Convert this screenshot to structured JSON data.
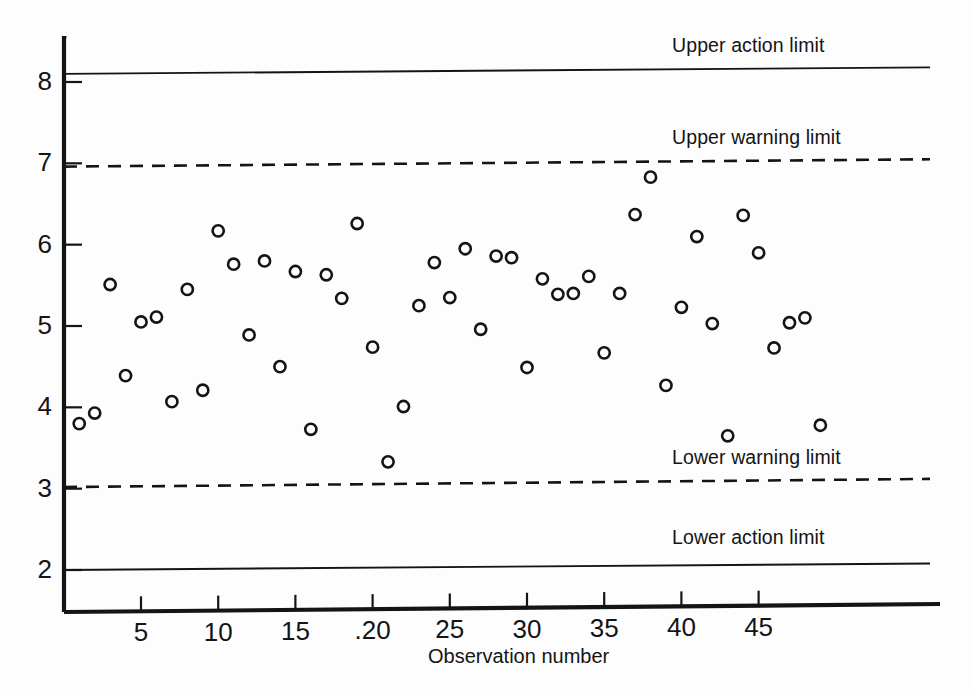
{
  "chart_data": {
    "type": "scatter",
    "title": "",
    "subtitle": "",
    "xlabel": "Observation number",
    "ylabel": "",
    "xlim": [
      0,
      50
    ],
    "ylim": [
      1.72,
      8.6
    ],
    "grid": false,
    "legend_position": "inline-right",
    "x_ticks": [
      5,
      10,
      15,
      20,
      25,
      30,
      35,
      40,
      45
    ],
    "x_tick_labels": [
      "5",
      "10",
      "15",
      ".20",
      "25",
      "30",
      "35",
      "40",
      "45"
    ],
    "y_ticks": [
      2,
      3,
      4,
      5,
      6,
      7,
      8
    ],
    "y_tick_labels": [
      "2",
      "3",
      "4",
      "5",
      "6",
      "7",
      "8"
    ],
    "series": [
      {
        "name": "Observations",
        "marker": "open-circle",
        "x": [
          1,
          2,
          3,
          4,
          5,
          6,
          7,
          8,
          9,
          10,
          11,
          12,
          13,
          14,
          15,
          16,
          17,
          18,
          19,
          20,
          21,
          22,
          23,
          24,
          25,
          26,
          27,
          28,
          29,
          30,
          31,
          32,
          33,
          34,
          35,
          36,
          37,
          38,
          39,
          40,
          41,
          42,
          43,
          44,
          45,
          46,
          47,
          48,
          49
        ],
        "values": [
          3.8,
          3.93,
          5.51,
          4.39,
          5.05,
          5.11,
          4.07,
          5.45,
          4.21,
          6.17,
          5.76,
          4.89,
          5.8,
          4.5,
          5.67,
          3.73,
          5.63,
          5.34,
          6.26,
          4.74,
          3.33,
          4.01,
          5.25,
          5.78,
          5.35,
          5.95,
          4.96,
          5.86,
          5.84,
          4.49,
          5.58,
          5.39,
          5.4,
          5.61,
          4.67,
          5.4,
          6.37,
          6.83,
          4.27,
          5.23,
          6.1,
          5.03,
          3.65,
          6.36,
          5.9,
          4.73,
          5.04,
          5.1,
          3.78
        ]
      }
    ],
    "control_limits": [
      {
        "name": "upper-action-limit",
        "label": "Upper action limit",
        "style": "solid",
        "value_left": 8.1,
        "value_right": 8.18,
        "label_x": 672,
        "label_y": 34
      },
      {
        "name": "upper-warning-limit",
        "label": "Upper warning limit",
        "style": "dashed",
        "value_left": 6.96,
        "value_right": 7.05,
        "label_x": 672,
        "label_y": 126
      },
      {
        "name": "lower-warning-limit",
        "label": "Lower warning limit",
        "style": "dashed",
        "value_left": 3.02,
        "value_right": 3.12,
        "label_x": 672,
        "label_y": 446
      },
      {
        "name": "lower-action-limit",
        "label": "Lower action limit",
        "style": "solid",
        "value_left": 2.0,
        "value_right": 2.08,
        "label_x": 672,
        "label_y": 526
      }
    ]
  },
  "axes": {
    "x_title": "Observation number",
    "x_title_left": 428,
    "x_title_top": 645
  },
  "colors": {
    "ink": "#141414",
    "background": "#fdfdfd"
  }
}
